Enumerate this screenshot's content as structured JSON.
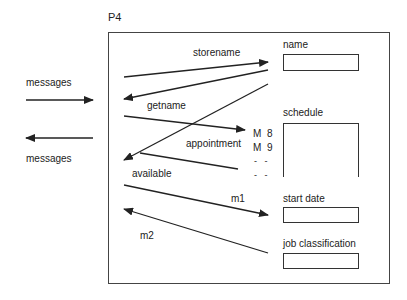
{
  "object": {
    "title": "P4"
  },
  "external": {
    "incoming_label": "messages",
    "outgoing_label": "messages"
  },
  "fields": [
    {
      "label": "name"
    },
    {
      "label": "schedule"
    },
    {
      "label": "start date"
    },
    {
      "label": "job classification"
    }
  ],
  "schedule_entries": [
    {
      "day": "M",
      "slot": "8"
    },
    {
      "day": "M",
      "slot": "9"
    },
    {
      "day": "-",
      "slot": "-"
    },
    {
      "day": "-",
      "slot": "-"
    }
  ],
  "methods": [
    {
      "label": "storename",
      "direction": "to-field",
      "target": "name"
    },
    {
      "label": "getname",
      "direction": "from-field",
      "target": "name"
    },
    {
      "label": "appointment",
      "direction": "to-field",
      "target": "schedule"
    },
    {
      "label": "available",
      "direction": "from-field",
      "target": "schedule"
    },
    {
      "label": "m1",
      "direction": "to-field",
      "target": "start date"
    },
    {
      "label": "m2",
      "direction": "from-field",
      "target": "job classification"
    }
  ],
  "colors": {
    "line": "#222222",
    "box_border": "#444444",
    "background": "#ffffff"
  }
}
